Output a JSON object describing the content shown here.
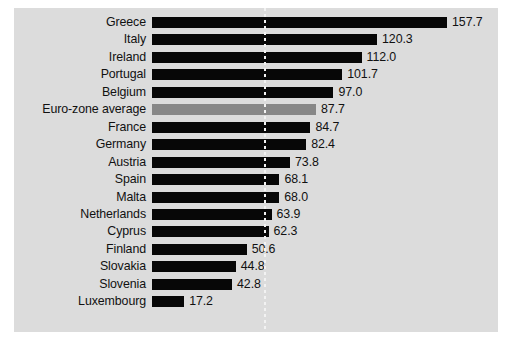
{
  "chart_data": {
    "type": "bar",
    "orientation": "horizontal",
    "title": "",
    "subtitle": "",
    "xlabel": "",
    "ylabel": "",
    "xlim": [
      0,
      165
    ],
    "grid": false,
    "legend": null,
    "value_label_format": "one-decimal",
    "reference_line": {
      "value": 60,
      "style": "dotted",
      "color": "#ffffff",
      "orientation": "vertical",
      "label": ""
    },
    "categories": [
      "Greece",
      "Italy",
      "Ireland",
      "Portugal",
      "Belgium",
      "Euro-zone average",
      "France",
      "Germany",
      "Austria",
      "Spain",
      "Malta",
      "Netherlands",
      "Cyprus",
      "Finland",
      "Slovakia",
      "Slovenia",
      "Luxembourg"
    ],
    "values": [
      157.7,
      120.3,
      112.0,
      101.7,
      97.0,
      87.7,
      84.7,
      82.4,
      73.8,
      68.1,
      68.0,
      63.9,
      62.3,
      50.6,
      44.8,
      42.8,
      17.2
    ],
    "value_labels": [
      "157.7",
      "120.3",
      "112.0",
      "101.7",
      "97.0",
      "87.7",
      "84.7",
      "82.4",
      "73.8",
      "68.1",
      "68.0",
      "63.9",
      "62.3",
      "50.6",
      "44.8",
      "42.8",
      "17.2"
    ],
    "highlight_index": 5,
    "colors": {
      "bar": "#070707",
      "highlight_bar": "#878787",
      "panel_background": "#dcdcdc",
      "text": "#111111",
      "reference_line": "#ffffff"
    }
  }
}
